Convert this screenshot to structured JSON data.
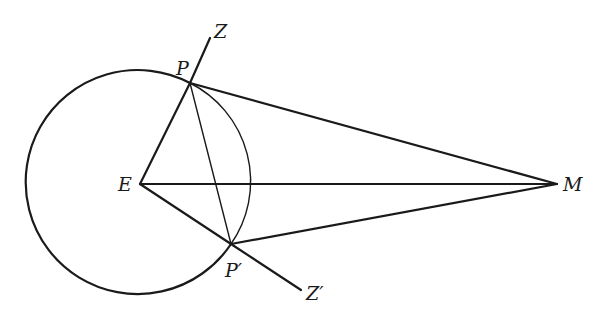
{
  "figure": {
    "type": "geometric-diagram",
    "background": "#ffffff",
    "ink": "#1a1a1a"
  },
  "points": {
    "E": {
      "label": "E",
      "x": 140,
      "y": 184
    },
    "P": {
      "label": "P",
      "x": 190,
      "y": 83
    },
    "P_prime": {
      "label": "P′",
      "x": 231,
      "y": 244
    },
    "M": {
      "label": "M",
      "x": 557,
      "y": 184
    },
    "Z": {
      "label": "Z",
      "x": 210,
      "y": 38
    },
    "Z_prime": {
      "label": "Z′",
      "x": 301,
      "y": 290
    }
  },
  "circle": {
    "center": "E",
    "radius": 112,
    "major_arc": "heavy (left side, from P through left to P′)",
    "minor_arc": "thin (right side, from P to P′)"
  },
  "segments": [
    {
      "from": "E",
      "to": "P",
      "style": "heavy"
    },
    {
      "from": "P",
      "to": "Z",
      "style": "heavy"
    },
    {
      "from": "E",
      "to": "P′",
      "style": "heavy"
    },
    {
      "from": "P′",
      "to": "Z′",
      "style": "heavy"
    },
    {
      "from": "E",
      "to": "M",
      "style": "heavy"
    },
    {
      "from": "P",
      "to": "M",
      "style": "heavy"
    },
    {
      "from": "P′",
      "to": "M",
      "style": "heavy"
    },
    {
      "from": "P",
      "to": "P′",
      "style": "thin"
    }
  ],
  "labels": {
    "Z": "Z",
    "P": "P",
    "E": "E",
    "M": "M",
    "P_prime": "P′",
    "Z_prime": "Z′"
  }
}
